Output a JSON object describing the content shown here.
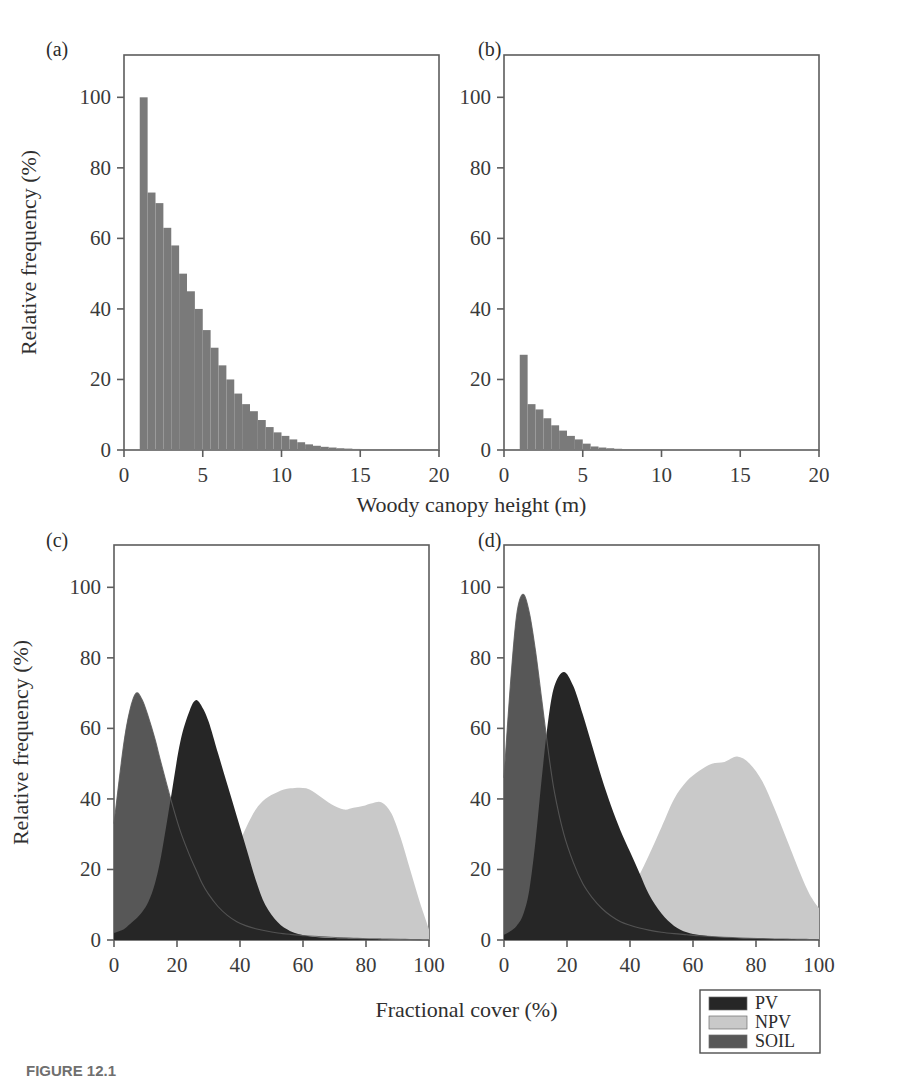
{
  "figure": {
    "caption": "FIGURE 12.1",
    "background_color": "#ffffff"
  },
  "colors": {
    "histogram_bar": "#7a7a7a",
    "pv": "#262626",
    "npv": "#c9c9c9",
    "soil": "#575757",
    "axis": "#5d5d5d",
    "text": "#2b2b2b"
  },
  "panels": [
    {
      "id": "a",
      "label": "(a)",
      "xlabel": "",
      "ylabel": "Relative frequency (%)"
    },
    {
      "id": "b",
      "label": "(b)",
      "xlabel": "Woody canopy height (m)",
      "ylabel": "Relative frequency (%)"
    },
    {
      "id": "c",
      "label": "(c)",
      "xlabel": "",
      "ylabel": "Relative frequency (%)"
    },
    {
      "id": "d",
      "label": "(d)",
      "xlabel": "Fractional cover (%)",
      "ylabel": "Relative frequency (%)"
    }
  ],
  "shared_axis_titles": {
    "top_row_x": "Woody canopy height (m)",
    "bottom_row_x": "Fractional cover (%)",
    "y": "Relative frequency (%)"
  },
  "legend": {
    "position": "bottom-right",
    "items": [
      {
        "label": "PV",
        "color": "#262626"
      },
      {
        "label": "NPV",
        "color": "#c9c9c9"
      },
      {
        "label": "SOIL",
        "color": "#575757"
      }
    ]
  },
  "chart_data": [
    {
      "type": "bar",
      "panel": "a",
      "title": "(a)",
      "xlabel": "Woody canopy height (m)",
      "ylabel": "Relative frequency (%)",
      "xlim": [
        0,
        20
      ],
      "ylim": [
        0,
        112
      ],
      "xticks": [
        0,
        5,
        10,
        15,
        20
      ],
      "yticks": [
        0,
        20,
        40,
        60,
        80,
        100
      ],
      "grid": false,
      "bin_width": 0.5,
      "bin_starts": [
        1.0,
        1.5,
        2.0,
        2.5,
        3.0,
        3.5,
        4.0,
        4.5,
        5.0,
        5.5,
        6.0,
        6.5,
        7.0,
        7.5,
        8.0,
        8.5,
        9.0,
        9.5,
        10.0,
        10.5,
        11.0,
        11.5,
        12.0,
        12.5,
        13.0,
        13.5,
        14.0,
        14.5,
        15.0,
        15.5,
        16.0,
        16.5,
        17.0,
        17.5,
        18.0,
        18.5,
        19.0,
        19.5
      ],
      "values": [
        100,
        73,
        70,
        63,
        58,
        50,
        45,
        40,
        34,
        29,
        24,
        20,
        16,
        13,
        11,
        8.5,
        6.5,
        5,
        4,
        3,
        2.2,
        1.6,
        1.2,
        0.9,
        0.7,
        0.5,
        0.4,
        0.3,
        0.25,
        0.2,
        0.15,
        0.12,
        0.1,
        0.08,
        0.06,
        0.05,
        0.04,
        0.03
      ]
    },
    {
      "type": "bar",
      "panel": "b",
      "title": "(b)",
      "xlabel": "Woody canopy height (m)",
      "ylabel": "Relative frequency (%)",
      "xlim": [
        0,
        20
      ],
      "ylim": [
        0,
        112
      ],
      "xticks": [
        0,
        5,
        10,
        15,
        20
      ],
      "yticks": [
        0,
        20,
        40,
        60,
        80,
        100
      ],
      "grid": false,
      "bin_width": 0.5,
      "bin_starts": [
        1.0,
        1.5,
        2.0,
        2.5,
        3.0,
        3.5,
        4.0,
        4.5,
        5.0,
        5.5,
        6.0,
        6.5,
        7.0,
        7.5,
        8.0,
        8.5,
        9.0,
        9.5,
        10.0
      ],
      "values": [
        27,
        13,
        11.5,
        9,
        7,
        5.5,
        4,
        3,
        1.8,
        1.0,
        0.7,
        0.5,
        0.35,
        0.25,
        0.2,
        0.15,
        0.1,
        0.08,
        0.05
      ]
    },
    {
      "type": "area",
      "panel": "c",
      "title": "(c)",
      "xlabel": "Fractional cover (%)",
      "ylabel": "Relative frequency (%)",
      "xlim": [
        0,
        100
      ],
      "ylim": [
        0,
        112
      ],
      "xticks": [
        0,
        20,
        40,
        60,
        80,
        100
      ],
      "yticks": [
        0,
        20,
        40,
        60,
        80,
        100
      ],
      "grid": false,
      "legend_position": "bottom-right",
      "x": [
        0,
        3,
        5,
        7,
        9,
        11,
        13,
        15,
        18,
        21,
        24,
        26,
        28,
        30,
        33,
        36,
        39,
        42,
        45,
        48,
        52,
        56,
        61,
        65,
        69,
        73,
        76,
        79,
        82,
        85,
        88,
        91,
        94,
        97,
        100
      ],
      "series": [
        {
          "name": "SOIL",
          "color": "#575757",
          "values": [
            33,
            55,
            65,
            70,
            68,
            63,
            57,
            50,
            40,
            31,
            24,
            20,
            16,
            13,
            9.5,
            7,
            5.2,
            4,
            3.2,
            2.6,
            2.0,
            1.6,
            1.2,
            1.0,
            0.8,
            0.6,
            0.5,
            0.4,
            0.35,
            0.3,
            0.25,
            0.2,
            0.15,
            0.1,
            0.05
          ]
        },
        {
          "name": "PV",
          "color": "#262626",
          "values": [
            2,
            3,
            4.5,
            6,
            8,
            11,
            16,
            24,
            40,
            56,
            65,
            68,
            66,
            62,
            53,
            44,
            35,
            26,
            17,
            10,
            5,
            2.5,
            1.2,
            0.8,
            0.6,
            0.5,
            0.4,
            0.3,
            0.25,
            0.2,
            0.15,
            0.12,
            0.1,
            0.07,
            0.04
          ]
        },
        {
          "name": "NPV",
          "color": "#c9c9c9",
          "values": [
            0.3,
            0.4,
            0.5,
            0.7,
            0.9,
            1.2,
            1.6,
            2.2,
            3.2,
            4.5,
            6.2,
            7.5,
            9,
            11,
            15,
            20,
            26,
            32,
            37,
            40,
            42,
            43,
            43,
            41,
            38.5,
            37,
            37.5,
            38,
            38.8,
            39,
            36,
            29,
            20,
            11,
            3
          ]
        }
      ],
      "outline_series": [
        {
          "name": "SOIL-outline",
          "values": [
            33,
            55,
            65,
            70,
            68,
            63,
            57,
            50,
            40,
            31,
            24,
            20,
            16,
            13,
            9.5,
            7,
            5.2,
            4,
            3.2,
            2.6,
            2.0,
            1.6,
            1.2,
            1.0,
            0.8,
            0.6,
            0.5,
            0.4,
            0.35,
            0.3,
            0.25,
            0.2,
            0.15,
            0.1,
            0.05
          ]
        }
      ]
    },
    {
      "type": "area",
      "panel": "d",
      "title": "(d)",
      "xlabel": "Fractional cover (%)",
      "ylabel": "Relative frequency (%)",
      "xlim": [
        0,
        100
      ],
      "ylim": [
        0,
        112
      ],
      "xticks": [
        0,
        20,
        40,
        60,
        80,
        100
      ],
      "yticks": [
        0,
        20,
        40,
        60,
        80,
        100
      ],
      "grid": false,
      "legend_position": "bottom-right",
      "x": [
        0,
        2,
        4,
        6,
        8,
        10,
        12,
        14,
        16,
        19,
        22,
        25,
        28,
        31,
        34,
        37,
        40,
        43,
        46,
        50,
        54,
        58,
        62,
        66,
        70,
        74,
        78,
        82,
        86,
        90,
        94,
        97,
        100
      ],
      "series": [
        {
          "name": "SOIL",
          "color": "#575757",
          "values": [
            46,
            72,
            92,
            98,
            93,
            82,
            68,
            54,
            42,
            30,
            22,
            16,
            12,
            9,
            6.8,
            5.2,
            4.2,
            3.4,
            2.8,
            2.2,
            1.8,
            1.5,
            1.2,
            1.0,
            0.8,
            0.65,
            0.5,
            0.4,
            0.3,
            0.25,
            0.2,
            0.15,
            0.1
          ]
        },
        {
          "name": "PV",
          "color": "#262626",
          "values": [
            1.5,
            2.5,
            4,
            7,
            14,
            28,
            46,
            62,
            72,
            76,
            72,
            64,
            55,
            46,
            38,
            31,
            25,
            19,
            13,
            7.5,
            4,
            2.2,
            1.4,
            1.0,
            0.8,
            0.6,
            0.5,
            0.4,
            0.3,
            0.25,
            0.2,
            0.15,
            0.1
          ]
        },
        {
          "name": "NPV",
          "color": "#c9c9c9",
          "values": [
            0.3,
            0.4,
            0.5,
            0.7,
            1.0,
            1.4,
            1.9,
            2.5,
            3.2,
            4.2,
            5.2,
            6.2,
            7.2,
            8.2,
            9.5,
            11.5,
            14.5,
            18.5,
            24,
            32,
            40,
            45,
            48,
            50,
            50.5,
            52,
            50,
            45,
            37,
            28,
            19,
            13,
            9
          ]
        }
      ],
      "outline_series": [
        {
          "name": "SOIL-outline",
          "values": [
            46,
            72,
            92,
            98,
            93,
            82,
            68,
            54,
            42,
            30,
            22,
            16,
            12,
            9,
            6.8,
            5.2,
            4.2,
            3.4,
            2.8,
            2.2,
            1.8,
            1.5,
            1.2,
            1.0,
            0.8,
            0.65,
            0.5,
            0.4,
            0.3,
            0.25,
            0.2,
            0.15,
            0.1
          ]
        }
      ]
    }
  ]
}
